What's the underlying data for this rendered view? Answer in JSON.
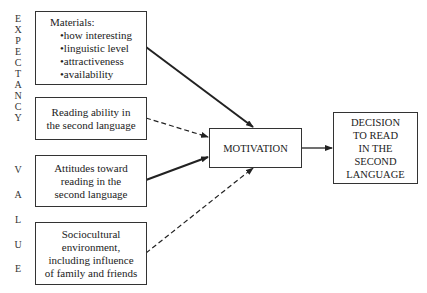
{
  "side_labels": {
    "expectancy": [
      "E",
      "X",
      "P",
      "E",
      "C",
      "T",
      "A",
      "N",
      "C",
      "Y"
    ],
    "value": [
      "V",
      "A",
      "L",
      "U",
      "E"
    ]
  },
  "boxes": {
    "materials": {
      "title": "Materials:",
      "items": [
        "how interesting",
        "linguistic level",
        "attractiveness",
        "availability"
      ]
    },
    "reading_ability": {
      "lines": [
        "Reading ability in",
        "the second language"
      ]
    },
    "attitudes": {
      "lines": [
        "Attitudes toward",
        "reading in the",
        "second language"
      ]
    },
    "sociocultural": {
      "lines": [
        "Sociocultural",
        "environment,",
        "including influence",
        "of family and friends"
      ]
    },
    "motivation": {
      "label": "MOTIVATION"
    },
    "decision": {
      "lines": [
        "DECISION",
        "TO READ",
        "IN THE",
        "SECOND",
        "LANGUAGE"
      ]
    }
  },
  "arrows": [
    {
      "from": "materials",
      "to": "motivation",
      "style": "solid"
    },
    {
      "from": "reading_ability",
      "to": "motivation",
      "style": "dashed"
    },
    {
      "from": "attitudes",
      "to": "motivation",
      "style": "solid"
    },
    {
      "from": "sociocultural",
      "to": "motivation",
      "style": "dashed"
    },
    {
      "from": "motivation",
      "to": "decision",
      "style": "solid"
    }
  ]
}
